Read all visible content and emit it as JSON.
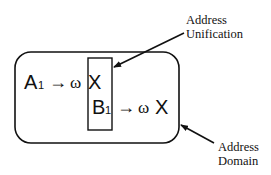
{
  "diagram": {
    "rule_a": {
      "symbol": "A",
      "subscript": "1",
      "arrow": "→",
      "omega": "ω",
      "target": "X"
    },
    "rule_b": {
      "symbol": "B",
      "subscript": "1",
      "arrow": "→",
      "omega": "ω",
      "target": "X"
    },
    "labels": {
      "unification_line1": "Address",
      "unification_line2": "Unification",
      "domain_line1": "Address",
      "domain_line2": "Domain"
    },
    "colors": {
      "stroke": "#111111",
      "background": "#ffffff"
    }
  }
}
